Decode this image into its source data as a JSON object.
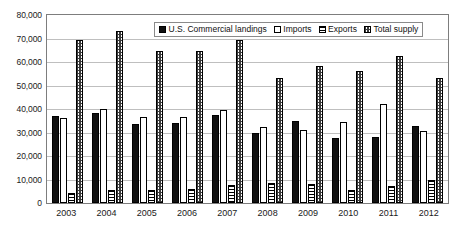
{
  "chart_data": {
    "type": "bar",
    "title": "",
    "xlabel": "",
    "ylabel": "",
    "ylim": [
      0,
      80000
    ],
    "grid": true,
    "legend_position": "top-center",
    "categories": [
      "2003",
      "2004",
      "2005",
      "2006",
      "2007",
      "2008",
      "2009",
      "2010",
      "2011",
      "2012"
    ],
    "ytick_labels": [
      "80,000",
      "70,000",
      "60,000",
      "50,000",
      "40,000",
      "30,000",
      "20,000",
      "10,000",
      "0"
    ],
    "ytick_values": [
      80000,
      70000,
      60000,
      50000,
      40000,
      30000,
      20000,
      10000,
      0
    ],
    "series": [
      {
        "name": "U.S. Commercial landings",
        "pattern": "solid-black",
        "color": "#111111",
        "values": [
          37000,
          38500,
          33600,
          34100,
          37500,
          29700,
          35100,
          27700,
          28000,
          32600
        ]
      },
      {
        "name": "Imports",
        "pattern": "white-empty",
        "color": "#ffffff",
        "values": [
          36200,
          40200,
          36800,
          36400,
          39500,
          32300,
          31200,
          34300,
          42300,
          30500
        ]
      },
      {
        "name": "Exports",
        "pattern": "horizontal-lines",
        "color": "#ffffff",
        "values": [
          4300,
          5700,
          5700,
          5800,
          7700,
          8700,
          8200,
          5400,
          7400,
          9900
        ]
      },
      {
        "name": "Total supply",
        "pattern": "checkerboard",
        "color": "#3a3a3a",
        "values": [
          69200,
          73000,
          64700,
          64800,
          69400,
          53400,
          58200,
          56200,
          62600,
          53200
        ]
      }
    ]
  },
  "legend": {
    "items": [
      {
        "label": "U.S. Commercial landings",
        "swatch": "solid-black-swatch"
      },
      {
        "label": "Imports",
        "swatch": "white-empty-swatch"
      },
      {
        "label": "Exports",
        "swatch": "horizontal-lines-swatch"
      },
      {
        "label": "Total supply",
        "swatch": "checkerboard-swatch"
      }
    ]
  }
}
